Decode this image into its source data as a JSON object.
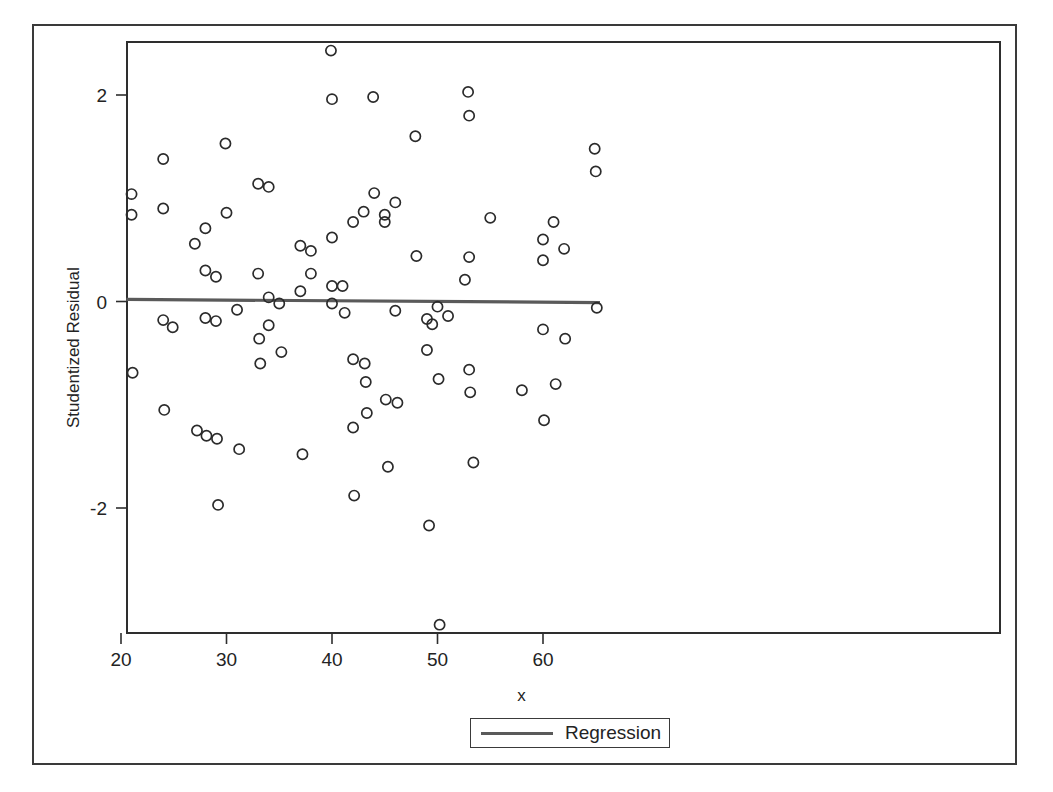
{
  "chart_data": {
    "type": "scatter",
    "title": "",
    "xlabel": "x",
    "ylabel": "Studentized Residual",
    "xlim": [
      20.0,
      65.5
    ],
    "ylim": [
      -3.3,
      2.6
    ],
    "xticks": [
      20,
      30,
      40,
      50,
      60
    ],
    "xticklabels": [
      "20",
      "30",
      "40",
      "50",
      "60"
    ],
    "yticks": [
      2,
      0,
      -2
    ],
    "yticklabels": [
      "2",
      "0",
      "-2"
    ],
    "grid": false,
    "legend_position": "bottom-center",
    "series": [
      {
        "name": "Observations",
        "marker": "open-circle",
        "color": "#2b2b2b",
        "points": [
          [
            21.0,
            1.04
          ],
          [
            21.0,
            0.84
          ],
          [
            21.1,
            -0.69
          ],
          [
            24.0,
            1.38
          ],
          [
            24.0,
            0.9
          ],
          [
            24.0,
            -0.18
          ],
          [
            24.1,
            -1.05
          ],
          [
            24.9,
            -0.25
          ],
          [
            27.0,
            0.56
          ],
          [
            27.2,
            -1.25
          ],
          [
            28.0,
            0.71
          ],
          [
            28.0,
            0.3
          ],
          [
            28.0,
            -0.16
          ],
          [
            28.1,
            -1.3
          ],
          [
            29.0,
            0.24
          ],
          [
            29.0,
            -0.19
          ],
          [
            29.1,
            -1.33
          ],
          [
            29.2,
            -1.97
          ],
          [
            29.9,
            1.53
          ],
          [
            30.0,
            0.86
          ],
          [
            31.0,
            -0.08
          ],
          [
            31.2,
            -1.43
          ],
          [
            33.0,
            1.14
          ],
          [
            33.0,
            0.27
          ],
          [
            33.1,
            -0.36
          ],
          [
            33.2,
            -0.6
          ],
          [
            34.0,
            1.11
          ],
          [
            34.0,
            0.04
          ],
          [
            34.0,
            -0.23
          ],
          [
            35.0,
            -0.02
          ],
          [
            35.2,
            -0.49
          ],
          [
            37.0,
            0.54
          ],
          [
            37.0,
            0.1
          ],
          [
            37.2,
            -1.48
          ],
          [
            38.0,
            0.49
          ],
          [
            38.0,
            0.27
          ],
          [
            39.9,
            2.43
          ],
          [
            40.0,
            1.96
          ],
          [
            40.0,
            0.62
          ],
          [
            40.0,
            0.15
          ],
          [
            40.0,
            -0.02
          ],
          [
            41.0,
            0.15
          ],
          [
            41.2,
            -0.11
          ],
          [
            42.0,
            0.77
          ],
          [
            42.0,
            -0.56
          ],
          [
            42.0,
            -1.22
          ],
          [
            42.1,
            -1.88
          ],
          [
            43.0,
            0.87
          ],
          [
            43.1,
            -0.6
          ],
          [
            43.2,
            -0.78
          ],
          [
            43.3,
            -1.08
          ],
          [
            43.9,
            1.98
          ],
          [
            44.0,
            1.05
          ],
          [
            45.0,
            0.84
          ],
          [
            45.0,
            0.77
          ],
          [
            45.1,
            -0.95
          ],
          [
            45.3,
            -1.6
          ],
          [
            46.0,
            0.96
          ],
          [
            46.0,
            -0.09
          ],
          [
            46.2,
            -0.98
          ],
          [
            47.9,
            1.6
          ],
          [
            48.0,
            0.44
          ],
          [
            49.0,
            -0.17
          ],
          [
            49.0,
            -0.47
          ],
          [
            49.2,
            -2.17
          ],
          [
            49.5,
            -0.22
          ],
          [
            50.0,
            -0.05
          ],
          [
            50.1,
            -0.75
          ],
          [
            50.2,
            -3.13
          ],
          [
            51.0,
            -0.14
          ],
          [
            52.9,
            2.03
          ],
          [
            53.0,
            1.8
          ],
          [
            53.0,
            0.43
          ],
          [
            53.0,
            -0.66
          ],
          [
            53.1,
            -0.88
          ],
          [
            52.6,
            0.21
          ],
          [
            53.4,
            -1.56
          ],
          [
            55.0,
            0.81
          ],
          [
            58.0,
            -0.86
          ],
          [
            60.0,
            0.6
          ],
          [
            60.0,
            0.4
          ],
          [
            60.0,
            -0.27
          ],
          [
            60.1,
            -1.15
          ],
          [
            61.0,
            0.77
          ],
          [
            61.2,
            -0.8
          ],
          [
            62.0,
            0.51
          ],
          [
            62.1,
            -0.36
          ],
          [
            64.9,
            1.48
          ],
          [
            65.0,
            1.26
          ],
          [
            65.1,
            -0.06
          ]
        ]
      }
    ],
    "regression": {
      "name": "Regression",
      "color": "#5a5a5a",
      "x_start": 20.5,
      "x_end": 65.4,
      "y_start": 0.02,
      "y_end": -0.01
    }
  },
  "legend": {
    "entries": [
      {
        "label": "Regression",
        "swatch": "line-swatch"
      }
    ]
  },
  "axes": {
    "x_title": "x",
    "y_title": "Studentized Residual"
  }
}
